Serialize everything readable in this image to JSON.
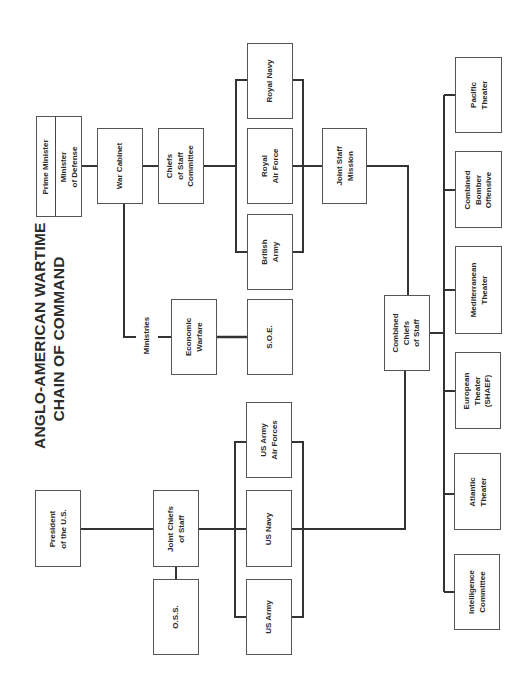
{
  "title": {
    "line1": "ANGLO-AMERICAN WARTIME",
    "line2": "CHAIN OF COMMAND"
  },
  "colors": {
    "line": "#333333",
    "box_border": "#555555",
    "text": "#2a2a2a",
    "background": "#ffffff"
  },
  "nodes": {
    "prime_minister": {
      "label": "Prime Minister"
    },
    "minister_of_defense": {
      "label": "Minister\nof Defense"
    },
    "war_cabinet": {
      "label": "War Cabinet"
    },
    "chiefs_of_staff_committee": {
      "label": "Chiefs\nof Staff\nCommittee"
    },
    "royal_navy": {
      "label": "Royal Navy"
    },
    "royal_air_force": {
      "label": "Royal\nAir Force"
    },
    "british_army": {
      "label": "British\nArmy"
    },
    "joint_staff_mission": {
      "label": "Joint Staff\nMission"
    },
    "economic_warfare": {
      "label": "Economic\nWarfare"
    },
    "soe": {
      "label": "S.O.E."
    },
    "combined_chiefs_of_staff": {
      "label": "Combined\nChiefs\nof Staff"
    },
    "pacific_theater": {
      "label": "Pacific\nTheater"
    },
    "combined_bomber_offensive": {
      "label": "Combined\nBomber\nOffensive"
    },
    "mediterranean_theater": {
      "label": "Mediterranean\nTheater"
    },
    "european_theater": {
      "label": "European\nTheater\n(SHAEF)"
    },
    "atlantic_theater": {
      "label": "Atlantic\nTheater"
    },
    "intelligence_committee": {
      "label": "Intelligence\nCommittee"
    },
    "president": {
      "label": "President\nof the U.S."
    },
    "joint_chiefs_of_staff": {
      "label": "Joint Chiefs\nof Staff"
    },
    "oss": {
      "label": "O.S.S."
    },
    "us_army_air_forces": {
      "label": "US Army\nAir Forces"
    },
    "us_navy": {
      "label": "US Navy"
    },
    "us_army": {
      "label": "US Army"
    }
  },
  "connector_labels": {
    "ministries": "Ministries"
  },
  "edges": [
    [
      "prime_minister",
      "war_cabinet"
    ],
    [
      "war_cabinet",
      "chiefs_of_staff_committee"
    ],
    [
      "chiefs_of_staff_committee",
      "royal_navy"
    ],
    [
      "chiefs_of_staff_committee",
      "royal_air_force"
    ],
    [
      "chiefs_of_staff_committee",
      "british_army"
    ],
    [
      "royal_air_force",
      "joint_staff_mission"
    ],
    [
      "war_cabinet",
      "economic_warfare"
    ],
    [
      "economic_warfare",
      "soe"
    ],
    [
      "joint_staff_mission",
      "combined_chiefs_of_staff"
    ],
    [
      "combined_chiefs_of_staff",
      "pacific_theater"
    ],
    [
      "combined_chiefs_of_staff",
      "combined_bomber_offensive"
    ],
    [
      "combined_chiefs_of_staff",
      "mediterranean_theater"
    ],
    [
      "combined_chiefs_of_staff",
      "european_theater"
    ],
    [
      "combined_chiefs_of_staff",
      "atlantic_theater"
    ],
    [
      "combined_chiefs_of_staff",
      "intelligence_committee"
    ],
    [
      "president",
      "joint_chiefs_of_staff"
    ],
    [
      "joint_chiefs_of_staff",
      "oss"
    ],
    [
      "joint_chiefs_of_staff",
      "us_army_air_forces"
    ],
    [
      "joint_chiefs_of_staff",
      "us_navy"
    ],
    [
      "joint_chiefs_of_staff",
      "us_army"
    ],
    [
      "us_navy",
      "combined_chiefs_of_staff"
    ]
  ]
}
